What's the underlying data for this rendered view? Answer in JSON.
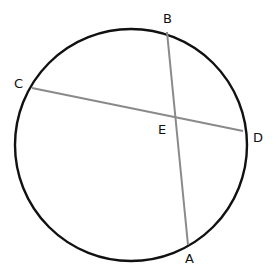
{
  "diagram": {
    "colors": {
      "circle": "#111111",
      "chord": "#8a8a8a",
      "label": "#111111",
      "background": "#ffffff"
    },
    "circle": {
      "cx": 131,
      "cy": 145,
      "r": 116
    },
    "points": {
      "A": {
        "label": "A",
        "x": 188,
        "y": 245,
        "lx": 185,
        "ly": 263
      },
      "B": {
        "label": "B",
        "x": 167,
        "y": 32,
        "lx": 163,
        "ly": 23
      },
      "C": {
        "label": "C",
        "x": 32,
        "y": 88,
        "lx": 14,
        "ly": 88
      },
      "D": {
        "label": "D",
        "x": 243,
        "y": 131,
        "lx": 253,
        "ly": 142
      },
      "E": {
        "label": "E",
        "x": 174,
        "y": 117,
        "lx": 158,
        "ly": 134
      }
    },
    "chords": [
      {
        "name": "AB",
        "from": "A",
        "to": "B"
      },
      {
        "name": "CD",
        "from": "C",
        "to": "D"
      }
    ]
  }
}
